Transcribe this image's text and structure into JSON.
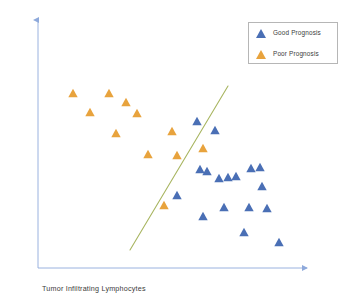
{
  "chart_data": {
    "type": "scatter",
    "title": "",
    "xlabel": "Tumor Infiltrating Lymphocytes",
    "ylabel": "Tumor Size",
    "grid": false,
    "legend_position": "top-right",
    "axis_style": "arrow-axes-no-ticks",
    "colors": {
      "good_prognosis": "#4A6FB5",
      "poor_prognosis": "#E8A33D",
      "separator_line": "#A8B560",
      "axis": "#8EA9DB",
      "legend_border": "#B6B6B6",
      "text": "#3B3B3B"
    },
    "series": [
      {
        "name": "Good Prognosis",
        "marker": "triangle",
        "color": "#4A6FB5",
        "points": [
          [
            197,
            121
          ],
          [
            215,
            130
          ],
          [
            200,
            169
          ],
          [
            219,
            178
          ],
          [
            228,
            177
          ],
          [
            251,
            168
          ],
          [
            260,
            167
          ],
          [
            262,
            186
          ],
          [
            177,
            195
          ],
          [
            203,
            216
          ],
          [
            224,
            207
          ],
          [
            249,
            207
          ],
          [
            267,
            208
          ],
          [
            244,
            232
          ],
          [
            279,
            242
          ],
          [
            236,
            176
          ],
          [
            207,
            171
          ]
        ]
      },
      {
        "name": "Poor Prognosis",
        "marker": "triangle",
        "color": "#E8A33D",
        "points": [
          [
            73,
            93
          ],
          [
            109,
            93
          ],
          [
            126,
            102
          ],
          [
            90,
            112
          ],
          [
            137,
            113
          ],
          [
            116,
            133
          ],
          [
            172,
            131
          ],
          [
            148,
            154
          ],
          [
            177,
            155
          ],
          [
            203,
            148
          ],
          [
            164,
            205
          ]
        ]
      }
    ],
    "annotations": [
      {
        "type": "line",
        "name": "decision-boundary",
        "color": "#A8B560",
        "x1": 228,
        "y1": 86,
        "x2": 130,
        "y2": 250
      }
    ],
    "axes": {
      "x": {
        "x1": 38,
        "y1": 268,
        "x2": 307,
        "y2": 268,
        "arrow": true
      },
      "y": {
        "x1": 38,
        "y1": 268,
        "x2": 38,
        "y2": 20,
        "arrow": true
      }
    }
  },
  "legend": {
    "items": [
      {
        "label": "Good Prognosis",
        "color": "#4A6FB5"
      },
      {
        "label": "Poor Prognosis",
        "color": "#E8A33D"
      }
    ]
  },
  "labels": {
    "x_axis": "Tumor Infiltrating Lymphocytes",
    "y_axis": "Tumor Size"
  }
}
